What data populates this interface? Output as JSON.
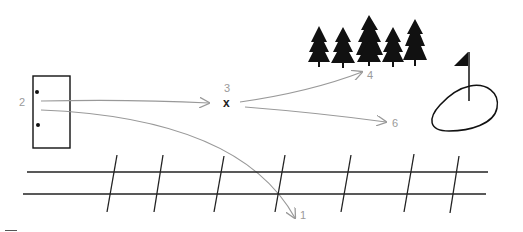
{
  "diagram": {
    "type": "trajectory-diagram",
    "colors": {
      "ink": "#111111",
      "arrow": "#999999",
      "label": "#9a9a9a",
      "background": "#ffffff"
    },
    "labels": {
      "start": "2",
      "midpoint": "3",
      "midpoint_marker": "x",
      "target_trees": "4",
      "target_right": "6",
      "target_fence": "1"
    },
    "elements": {
      "box": "rectangle-with-two-dots",
      "trees": "five-pine-trees",
      "flag": "flag-on-green",
      "fence": "two-rails-with-seven-posts"
    }
  }
}
